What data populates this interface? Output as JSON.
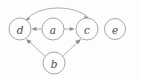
{
  "figure": {
    "kind": "directed-graph",
    "width": 141,
    "height": 79,
    "background_color": "#fdfdfd",
    "node_fill_color": "#fdfdfd",
    "node_stroke_color": "#9a9a9a",
    "edge_color": "#9a9a9a",
    "arrow_color": "#8d8d8d",
    "label_color": "#4a4a4a",
    "node_radius": 11
  },
  "nodes": [
    {
      "id": "d",
      "label": "d",
      "cx": 20,
      "cy": 29,
      "r": 11
    },
    {
      "id": "a",
      "label": "a",
      "cx": 53,
      "cy": 29,
      "r": 11
    },
    {
      "id": "c",
      "label": "c",
      "cx": 87,
      "cy": 29,
      "r": 11
    },
    {
      "id": "e",
      "label": "e",
      "cx": 115,
      "cy": 29,
      "r": 10.5
    },
    {
      "id": "b",
      "label": "b",
      "cx": 54,
      "cy": 63,
      "r": 11
    }
  ],
  "edges": [
    {
      "id": "a-to-d",
      "from": "a",
      "to": "d",
      "shape": "straight",
      "directed": true,
      "label": ""
    },
    {
      "id": "a-to-c",
      "from": "a",
      "to": "c",
      "shape": "straight",
      "directed": true,
      "label": ""
    },
    {
      "id": "b-to-d",
      "from": "b",
      "to": "d",
      "shape": "straight",
      "directed": true,
      "label": ""
    },
    {
      "id": "b-to-c",
      "from": "b",
      "to": "c",
      "shape": "straight",
      "directed": true,
      "label": ""
    },
    {
      "id": "d-c-arc",
      "from": "d",
      "to": "c",
      "shape": "curved-arc-above",
      "directed": true,
      "bidirectional": true,
      "label": ""
    }
  ],
  "isolated_nodes": [
    "e"
  ]
}
